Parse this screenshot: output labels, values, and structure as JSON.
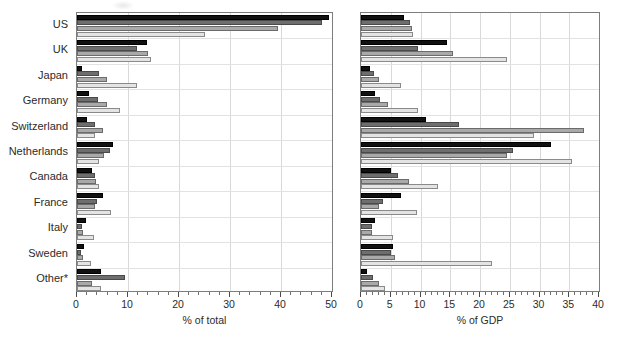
{
  "chart_data": [
    {
      "type": "bar",
      "orientation": "horizontal",
      "title": "",
      "xlabel": "% of total",
      "ylabel": "",
      "xlim": [
        0,
        50
      ],
      "xticks": [
        0,
        10,
        20,
        30,
        40,
        50
      ],
      "xtick_labels": [
        "0",
        "10",
        "20",
        "30",
        "40",
        "50"
      ],
      "minor_tick_step": 2,
      "grid": "vertical",
      "legend": "none",
      "categories": [
        "US",
        "UK",
        "Japan",
        "Germany",
        "Switzerland",
        "Netherlands",
        "Canada",
        "France",
        "Italy",
        "Sweden",
        "Other*"
      ],
      "series": [
        {
          "name": "series-1",
          "shade": "black",
          "values": [
            49.5,
            13.8,
            1.0,
            2.3,
            1.9,
            7.0,
            2.9,
            5.1,
            1.7,
            1.4,
            4.8
          ]
        },
        {
          "name": "series-2",
          "shade": "dark-gray",
          "values": [
            48.0,
            11.7,
            4.3,
            4.2,
            3.5,
            6.5,
            3.5,
            4.0,
            0.9,
            0.7,
            9.5
          ]
        },
        {
          "name": "series-3",
          "shade": "mid-gray",
          "values": [
            39.5,
            14.0,
            5.8,
            5.8,
            5.1,
            5.2,
            3.7,
            3.5,
            1.1,
            1.2,
            3.0
          ]
        },
        {
          "name": "series-4",
          "shade": "light-gray",
          "values": [
            25.0,
            14.5,
            11.7,
            8.5,
            3.6,
            4.4,
            4.3,
            6.7,
            3.4,
            2.8,
            4.8
          ]
        }
      ]
    },
    {
      "type": "bar",
      "orientation": "horizontal",
      "title": "",
      "xlabel": "% of GDP",
      "ylabel": "",
      "xlim": [
        0,
        40
      ],
      "xticks": [
        0,
        5,
        10,
        15,
        20,
        25,
        30,
        35,
        40
      ],
      "xtick_labels": [
        "0",
        "5",
        "10",
        "15",
        "20",
        "25",
        "30",
        "35",
        "40"
      ],
      "minor_tick_step": 1,
      "grid": "vertical",
      "legend": "none",
      "categories": [
        "US",
        "UK",
        "Japan",
        "Germany",
        "Switzerland",
        "Netherlands",
        "Canada",
        "France",
        "Italy",
        "Sweden",
        "Other*"
      ],
      "series": [
        {
          "name": "series-1",
          "shade": "black",
          "values": [
            7.3,
            14.5,
            1.5,
            2.3,
            11.0,
            32.0,
            5.0,
            6.7,
            2.4,
            5.4,
            1.0
          ]
        },
        {
          "name": "series-2",
          "shade": "dark-gray",
          "values": [
            8.3,
            9.5,
            2.2,
            3.2,
            16.5,
            25.5,
            6.2,
            3.7,
            1.8,
            5.0,
            2.0
          ]
        },
        {
          "name": "series-3",
          "shade": "mid-gray",
          "values": [
            8.5,
            15.5,
            3.0,
            4.5,
            37.5,
            24.5,
            8.0,
            3.0,
            1.8,
            5.7,
            3.0
          ]
        },
        {
          "name": "series-4",
          "shade": "light-gray",
          "values": [
            8.7,
            24.5,
            6.8,
            9.5,
            29.0,
            35.5,
            13.0,
            9.4,
            5.3,
            22.0,
            4.0
          ]
        }
      ]
    }
  ],
  "axes": {
    "left": {
      "title": "% of total"
    },
    "right": {
      "title": "% of GDP"
    }
  }
}
